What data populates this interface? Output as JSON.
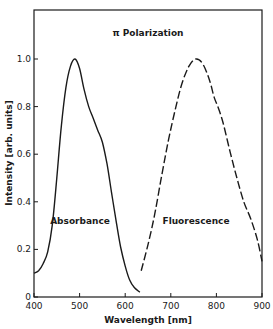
{
  "chart_data": {
    "type": "line",
    "title": "π Polarization",
    "xlabel": "Wavelength [nm]",
    "ylabel": "Intensity [arb. units]",
    "xlim": [
      400,
      900
    ],
    "ylim": [
      0,
      1.2
    ],
    "xticks": [
      400,
      500,
      600,
      700,
      800,
      900
    ],
    "xtick_labels": [
      "400",
      "500",
      "600",
      "700",
      "800",
      "900"
    ],
    "yticks": [
      0,
      0.2,
      0.4,
      0.6,
      0.8,
      1.0
    ],
    "ytick_labels": [
      "0",
      "0.2",
      "0.4",
      "0.6",
      "0.8",
      "1.0"
    ],
    "grid": false,
    "legend": "none (curves annotated inline)",
    "series": [
      {
        "name": "Absorbance",
        "style": "solid",
        "x": [
          400,
          410,
          420,
          430,
          440,
          450,
          460,
          470,
          480,
          490,
          500,
          510,
          520,
          530,
          540,
          550,
          560,
          570,
          580,
          590,
          600,
          610,
          620,
          632
        ],
        "y": [
          0.1,
          0.11,
          0.14,
          0.19,
          0.3,
          0.5,
          0.72,
          0.88,
          0.97,
          1.0,
          0.96,
          0.87,
          0.8,
          0.75,
          0.7,
          0.65,
          0.56,
          0.44,
          0.32,
          0.21,
          0.13,
          0.07,
          0.04,
          0.02
        ]
      },
      {
        "name": "Fluorescence",
        "style": "dashed",
        "x": [
          635,
          650,
          665,
          680,
          695,
          710,
          725,
          740,
          755,
          770,
          785,
          795,
          805,
          815,
          830,
          845,
          860,
          875,
          890,
          900
        ],
        "y": [
          0.11,
          0.22,
          0.35,
          0.51,
          0.66,
          0.79,
          0.9,
          0.97,
          1.0,
          0.98,
          0.91,
          0.84,
          0.79,
          0.73,
          0.61,
          0.5,
          0.4,
          0.33,
          0.24,
          0.15
        ]
      }
    ],
    "annotations": [
      {
        "text": "Absorbance",
        "x": 520,
        "y": 0.3
      },
      {
        "text": "Fluorescence",
        "x": 770,
        "y": 0.3
      }
    ]
  },
  "labels": {
    "title": "π Polarization",
    "xlabel": "Wavelength [nm]",
    "ylabel": "Intensity [arb. units]",
    "absorbance": "Absorbance",
    "fluorescence": "Fluorescence"
  }
}
